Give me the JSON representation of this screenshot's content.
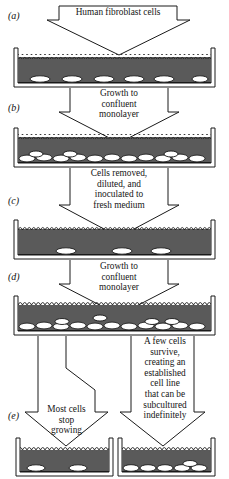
{
  "figure": {
    "panel_labels": [
      "(a)",
      "(b)",
      "(c)",
      "(d)",
      "(e)"
    ],
    "colors": {
      "medium": "#5a5a5a",
      "medium_dark": "#4e4e4e",
      "cell_fill": "#ffffff",
      "outline": "#1a1a1a",
      "background": "#ffffff"
    }
  },
  "steps": {
    "top_label": "Human fibroblast cells",
    "a_to_b": "Growth to\nconfluent\nmonolayer",
    "b_to_c": "Cells removed,\ndiluted, and\ninoculated to\nfresh medium",
    "c_to_d": "Growth to\nconfluent\nmonolayer",
    "d_to_e_left": "Most cells\nstop\ngrowing",
    "d_to_e_right": "A few cells\nsurvive,\ncreating an\nestablished\ncell line\nthat can be\nsubcultured\nindefinitely"
  },
  "dishes": [
    {
      "id": "dish-a",
      "panel": "(a)",
      "cell_count": 6,
      "description": "sparse cells on dish floor",
      "cell_positions": [
        32,
        61,
        90,
        119,
        148,
        190
      ],
      "confluent": false
    },
    {
      "id": "dish-b",
      "panel": "(b)",
      "cell_count": 14,
      "description": "confluent monolayer of cells",
      "confluent": true
    },
    {
      "id": "dish-c",
      "panel": "(c)",
      "cell_count": 3,
      "description": "sparse cells after dilution",
      "cell_positions": [
        62,
        118,
        157
      ],
      "confluent": false
    },
    {
      "id": "dish-d",
      "panel": "(d)",
      "cell_count": 15,
      "description": "confluent monolayer of cells",
      "confluent": true
    },
    {
      "id": "dish-e-left",
      "panel": "(e)",
      "cell_count": 2,
      "description": "most cells stop growing",
      "cell_positions": [
        25,
        70
      ],
      "confluent": false
    },
    {
      "id": "dish-e-right",
      "panel": "(e)",
      "cell_count": 6,
      "description": "established cell line, dense cells",
      "confluent": true
    }
  ]
}
